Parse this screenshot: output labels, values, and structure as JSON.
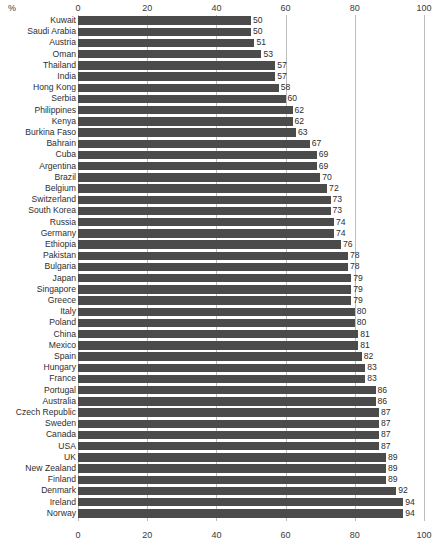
{
  "chart_data": {
    "type": "bar",
    "orientation": "horizontal",
    "title": "",
    "subtitle": "",
    "xlabel": "%",
    "ylabel": "",
    "xlim": [
      0,
      100
    ],
    "xticks": [
      0,
      20,
      40,
      60,
      80,
      100
    ],
    "xtick_labels": [
      "0",
      "20",
      "40",
      "60",
      "80",
      "100"
    ],
    "grid": true,
    "grid_axis": "x",
    "legend": false,
    "legend_position": "none",
    "axis_top": true,
    "axis_bottom": true,
    "bar_color": "#4b4b4b",
    "grid_color": "#bdbdbd",
    "text_color": "#2e2e2e",
    "background": "#ffffff",
    "value_labels": true,
    "categories": [
      "Kuwait",
      "Saudi Arabia",
      "Austria",
      "Oman",
      "Thailand",
      "India",
      "Hong Kong",
      "Serbia",
      "Philippines",
      "Kenya",
      "Burkina Faso",
      "Bahrain",
      "Cuba",
      "Argentina",
      "Brazil",
      "Belgium",
      "Switzerland",
      "South Korea",
      "Russia",
      "Germany",
      "Ethiopia",
      "Pakistan",
      "Bulgaria",
      "Japan",
      "Singapore",
      "Greece",
      "Italy",
      "Poland",
      "China",
      "Mexico",
      "Spain",
      "Hungary",
      "France",
      "Portugal",
      "Australia",
      "Czech Republic",
      "Sweden",
      "Canada",
      "USA",
      "UK",
      "New Zealand",
      "Finland",
      "Denmark",
      "Ireland",
      "Norway"
    ],
    "values": [
      50,
      50,
      51,
      53,
      57,
      57,
      58,
      60,
      62,
      62,
      63,
      67,
      69,
      69,
      70,
      72,
      73,
      73,
      74,
      74,
      76,
      78,
      78,
      79,
      79,
      79,
      80,
      80,
      81,
      81,
      82,
      83,
      83,
      86,
      86,
      87,
      87,
      87,
      87,
      89,
      89,
      89,
      92,
      94,
      94
    ]
  }
}
